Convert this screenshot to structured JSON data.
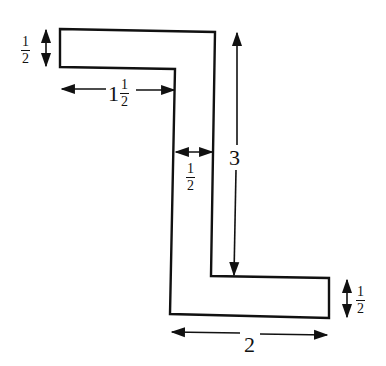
{
  "diagram": {
    "shape": "Z-shaped outline",
    "dimensions": {
      "top_thickness": {
        "whole": "",
        "num": "1",
        "den": "2"
      },
      "top_overhang": {
        "whole": "1",
        "num": "1",
        "den": "2"
      },
      "web_width": {
        "whole": "",
        "num": "1",
        "den": "2"
      },
      "height": "3",
      "bottom_thickness": {
        "whole": "",
        "num": "1",
        "den": "2"
      },
      "bottom_length": "2"
    },
    "stroke_color": "#111111"
  }
}
